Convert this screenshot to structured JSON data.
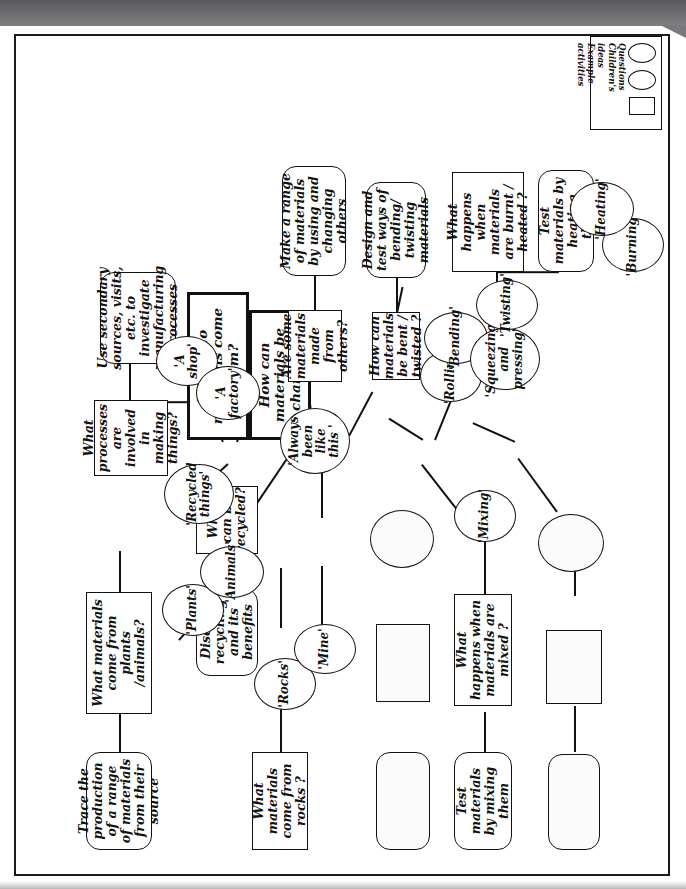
{
  "document": {
    "title": "Materials concept map",
    "orientation": "rotated-90"
  },
  "legend": {
    "shapes": [
      "rectangle",
      "ellipse",
      "ellipse"
    ],
    "entries": [
      "Questions",
      "Children's",
      "ideas",
      "Example",
      "activities"
    ],
    "labels_text": "Questions\nChildren's\nideas\nExample\nactivities"
  },
  "central": {
    "q1": "Where do materials come from?",
    "q2": "How can materials be changed?"
  },
  "questions": {
    "materials_plants_animals": "What materials come from plants /animals?",
    "what_can_be_recycled": "What can be recycled?",
    "processes_making_things": "What processes are involved in making things?",
    "materials_from_rocks": "What materials come from rocks ?",
    "made_from_others": "Are some materials made from others?",
    "bent_twisted": "How can materials be bent / twisted ?",
    "mixed": "What happens when materials are mixed ?",
    "burnt_heated": "What happens when materials are burnt / heated ?"
  },
  "activities": {
    "trace_production": "Trace the production of a range of materials from their source",
    "discuss_recycling": "Discuss recycling and its benefits",
    "secondary_sources": "Use secondary sources, visits, etc. to investigate manufacturing processes",
    "make_range": "Make a range of materials by using and changing others",
    "design_test": "Design and test ways of bending/ twisting materials",
    "test_mixing": "Test materials by mixing them",
    "test_heating": "Test materials by heating them"
  },
  "ideas": {
    "plants": "'Plants'",
    "animals": "'Animals'",
    "recycled_things": "'Recycled things'",
    "a_shop": "'A shop'",
    "a_factory": "'A factory'",
    "rocks": "'Rocks'",
    "mine": "'Mine'",
    "always_been_like_this": "'Always been like this '",
    "rolling": "'Rolling'",
    "bending": "'Bending'",
    "squeezing_pressing": "'Squeezing' and pressing'",
    "twisting": "'Twisting'",
    "mixing": "'Mixing'",
    "burning": "'Burning'",
    "heating": "'Heating'"
  },
  "blanks": {
    "blank_ellipse_1": "",
    "blank_rect_1": "",
    "blank_rounded_1": "",
    "blank_ellipse_2": "",
    "blank_rect_2": "",
    "blank_rounded_2": ""
  },
  "colors": {
    "ink": "#111111",
    "paper": "#ffffff",
    "scan_band": "#6e6e70"
  }
}
